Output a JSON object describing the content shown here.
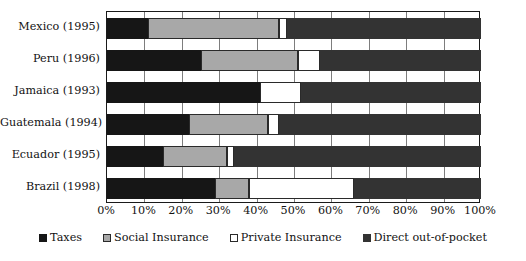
{
  "chart_data": {
    "type": "bar",
    "orientation": "horizontal",
    "stacked": true,
    "stack_mode": "percent",
    "title": "",
    "subtitle": "",
    "xlabel": "",
    "ylabel": "",
    "xlim": [
      0,
      100
    ],
    "grid": true,
    "legend_position": "bottom",
    "categories": [
      "Mexico (1995)",
      "Peru (1996)",
      "Jamaica (1993)",
      "Guatemala (1994)",
      "Ecuador (1995)",
      "Brazil (1998)"
    ],
    "xticks": [
      0,
      10,
      20,
      30,
      40,
      50,
      60,
      70,
      80,
      90,
      100
    ],
    "xtick_labels": [
      "0%",
      "10%",
      "20%",
      "30%",
      "40%",
      "50%",
      "60%",
      "70%",
      "80%",
      "90%",
      "100%"
    ],
    "series": [
      {
        "name": "Taxes",
        "color": "#161616",
        "values": [
          11,
          25,
          41,
          22,
          15,
          29
        ]
      },
      {
        "name": "Social Insurance",
        "color": "#a8a8a8",
        "values": [
          35,
          26,
          0,
          21,
          17,
          9
        ]
      },
      {
        "name": "Private Insurance",
        "color": "#ffffff",
        "values": [
          2,
          6,
          11,
          3,
          2,
          28
        ]
      },
      {
        "name": "Direct out-of-pocket",
        "color": "#333333",
        "values": [
          52,
          43,
          48,
          54,
          66,
          34
        ]
      }
    ]
  },
  "legend": {
    "items": [
      {
        "label": "Taxes",
        "swatch": "taxes"
      },
      {
        "label": "Social Insurance",
        "swatch": "social"
      },
      {
        "label": "Private Insurance",
        "swatch": "private"
      },
      {
        "label": "Direct out-of-pocket",
        "swatch": "direct"
      }
    ]
  }
}
